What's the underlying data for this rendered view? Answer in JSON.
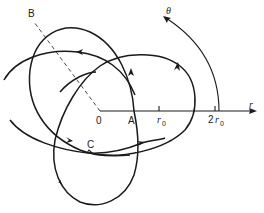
{
  "diagram": {
    "labels": {
      "origin": "0",
      "point_a": "A",
      "point_b": "B",
      "point_c": "C",
      "r_axis": "r",
      "theta": "θ",
      "r0": "r",
      "r0_sub": "0",
      "two_r0_coef": "2",
      "two_r0": "r",
      "two_r0_sub": "0"
    },
    "colors": {
      "line": "#1a1a1a",
      "background": "#ffffff"
    }
  }
}
